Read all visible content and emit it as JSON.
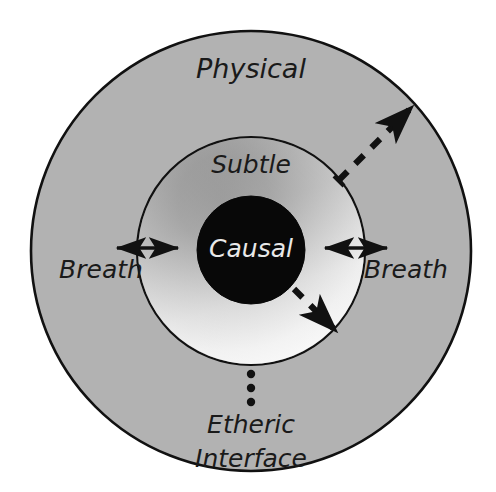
{
  "diagram": {
    "type": "concentric-circles",
    "background_color": "#ffffff",
    "rings": [
      {
        "name": "physical",
        "label": "Physical",
        "label_color": "#1a1a1a",
        "fill_color": "#b2b2b2",
        "stroke_color": "#111111",
        "center": [
          251,
          251
        ],
        "radius": 220,
        "label_position": [
          251,
          70
        ],
        "font_size": 27
      },
      {
        "name": "subtle",
        "label": "Subtle",
        "label_color": "#1a1a1a",
        "fill_gradient_from": "#9a9a9a",
        "fill_gradient_to": "#fbfbfb",
        "stroke_color": "#111111",
        "center": [
          251,
          251
        ],
        "radius": 114,
        "label_position": [
          251,
          166
        ],
        "font_size": 25
      },
      {
        "name": "causal",
        "label": "Causal",
        "label_color": "#e8e8e8",
        "fill_color": "#080808",
        "stroke_color": "#080808",
        "center": [
          251,
          250
        ],
        "radius": 54,
        "label_position": [
          251,
          250
        ],
        "font_size": 25
      }
    ],
    "breath_arrows": [
      {
        "name": "breath-left",
        "label": "Breath",
        "label_position": [
          101,
          270
        ],
        "font_size": 25,
        "arrow_from": [
          117,
          248
        ],
        "arrow_to": [
          178,
          248
        ],
        "double_headed": true,
        "color": "#111111"
      },
      {
        "name": "breath-right",
        "label": "Breath",
        "label_position": [
          406,
          270
        ],
        "font_size": 25,
        "arrow_from": [
          325,
          248
        ],
        "arrow_to": [
          387,
          248
        ],
        "double_headed": true,
        "color": "#111111"
      }
    ],
    "dashed_arrows": [
      {
        "name": "outward-dashed-arrow",
        "direction": "outward-upper-right",
        "from": [
          339,
          180
        ],
        "to": [
          415,
          104
        ],
        "color": "#111111"
      },
      {
        "name": "inward-dashed-arrow",
        "direction": "inward-lower-right",
        "from": [
          296,
          291
        ],
        "to": [
          337,
          332
        ],
        "color": "#111111"
      }
    ],
    "etheric_interface": {
      "name": "etheric-interface",
      "line1": "Etheric",
      "line2": "Interface",
      "label_color": "#1a1a1a",
      "font_size": 25,
      "line1_position": [
        251,
        425
      ],
      "line2_position": [
        251,
        459
      ],
      "dots": [
        {
          "cx": 251,
          "cy": 374,
          "r": 4
        },
        {
          "cx": 251,
          "cy": 388,
          "r": 4
        },
        {
          "cx": 251,
          "cy": 402,
          "r": 4
        }
      ],
      "dot_color": "#111111"
    }
  }
}
